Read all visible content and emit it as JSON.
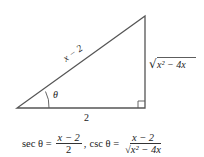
{
  "diagram": {
    "hypotenuse_label": "x − 2",
    "opposite_label_radicand": "x² − 4x",
    "adjacent_label": "2",
    "angle_label": "θ",
    "right_angle_marker": true
  },
  "formula": {
    "sec_lhs": "sec θ =",
    "sec_num": "x − 2",
    "sec_den": "2",
    "separator": ",",
    "csc_lhs": "csc θ =",
    "csc_num": "x − 2",
    "csc_den_radicand": "x² − 4x"
  }
}
